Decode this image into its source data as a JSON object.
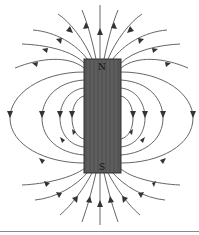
{
  "figure": {
    "magnet": {
      "north_label": "N",
      "south_label": "S",
      "x": 84,
      "y": 59,
      "width": 37,
      "height": 114,
      "fill": "#555555"
    },
    "line_color": "#555555",
    "arrow_direction": "outward from N, inward to S"
  }
}
